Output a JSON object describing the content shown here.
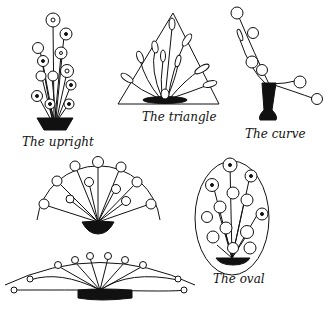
{
  "figures": [
    {
      "id": "upright",
      "label": "The upright"
    },
    {
      "id": "triangle",
      "label": "The triangle"
    },
    {
      "id": "curve",
      "label": "The curve"
    },
    {
      "id": "fan",
      "label": ""
    },
    {
      "id": "crescent",
      "label": ""
    },
    {
      "id": "oval",
      "label": "The oval"
    }
  ],
  "colors": {
    "ink": "#111111",
    "paper": "#ffffff"
  }
}
